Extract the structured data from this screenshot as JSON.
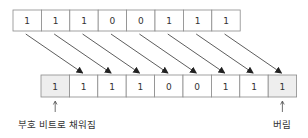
{
  "diagram": {
    "title": "",
    "top_row": {
      "bits": [
        "1",
        "1",
        "1",
        "0",
        "0",
        "1",
        "1",
        "1"
      ],
      "x": 13,
      "y": 10,
      "cell_w": 28.4,
      "cell_h": 21
    },
    "bottom_row": {
      "bits": [
        "1",
        "1",
        "1",
        "1",
        "0",
        "0",
        "1",
        "1",
        "1"
      ],
      "shaded": [
        0,
        8
      ],
      "x": 41,
      "y": 75,
      "cell_w": 28.4,
      "cell_h": 22
    },
    "labels": {
      "sign_fill": "부호 비트로 채워짐",
      "discard": "버림"
    },
    "colors": {
      "border": "#8a8a8a",
      "shade": "#eeeeee",
      "arrow": "#333333",
      "text": "#333333"
    }
  }
}
